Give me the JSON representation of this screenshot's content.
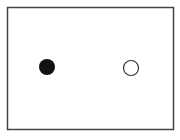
{
  "diagram": {
    "frame": {
      "x": 7,
      "y": 7,
      "width": 166,
      "height": 122,
      "stroke": "#444444"
    },
    "shapes": [
      {
        "kind": "circle",
        "fill": "filled",
        "cx": 47,
        "cy": 67,
        "r": 8,
        "color": "#111111"
      },
      {
        "kind": "circle",
        "fill": "open",
        "cx": 131,
        "cy": 68,
        "r": 8,
        "color": "#333333"
      }
    ]
  }
}
